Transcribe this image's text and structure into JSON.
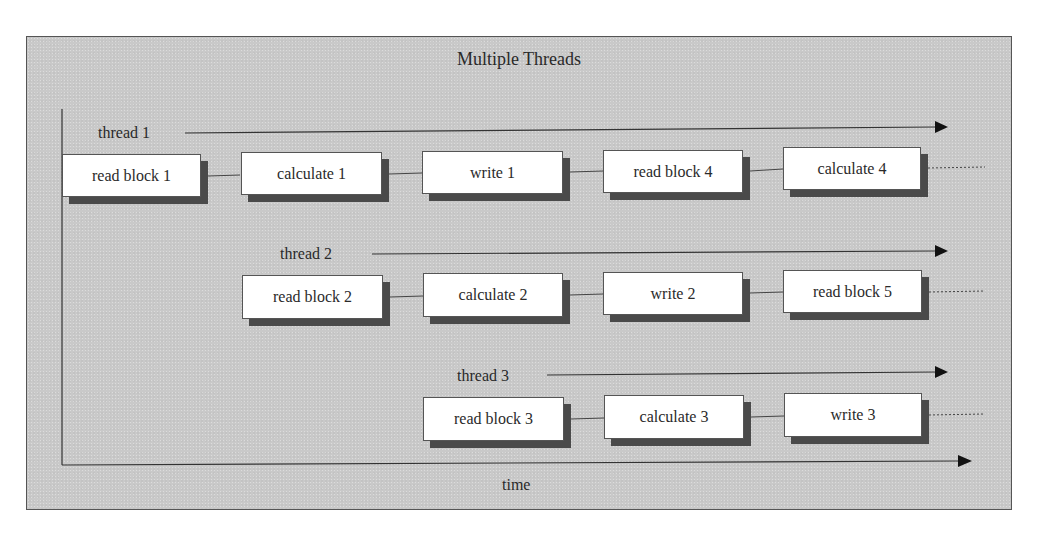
{
  "diagram": {
    "title": "Multiple Threads",
    "time_axis_label": "time",
    "colors": {
      "panel_background": "#c9c9c9",
      "box_fill": "#ffffff",
      "box_shadow": "#4a4a4a",
      "line": "#333333"
    },
    "threads": [
      {
        "label": "thread 1",
        "tasks": [
          "read block 1",
          "calculate 1",
          "write 1",
          "read block 4",
          "calculate 4"
        ],
        "continues": true
      },
      {
        "label": "thread 2",
        "tasks": [
          "read block 2",
          "calculate 2",
          "write 2",
          "read block 5"
        ],
        "continues": true
      },
      {
        "label": "thread 3",
        "tasks": [
          "read block 3",
          "calculate 3",
          "write 3"
        ],
        "continues": true
      }
    ]
  }
}
